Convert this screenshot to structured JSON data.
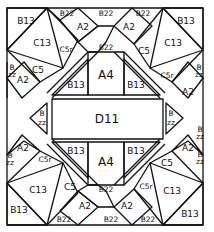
{
  "diagram": {
    "type": "quilt-block-piecing-diagram",
    "line_color": "#111111",
    "background": "#ffffff",
    "center": {
      "label": "D11"
    },
    "center_side_triangles": {
      "left": "B\nzz",
      "right": "B\nzz"
    },
    "top_center": {
      "square": "A4",
      "left_triangle": "B13",
      "right_triangle": "B13",
      "top_triangle": "B22"
    },
    "bottom_center": {
      "square": "A4",
      "left_triangle": "B13",
      "right_triangle": "B13",
      "bottom_triangle": "B22"
    },
    "corners": {
      "top_left": {
        "large_triangle": "B13",
        "square_triangle": "C13",
        "kite_a": "C5r",
        "kite_b": "C5"
      },
      "top_right": {
        "large_triangle": "B13",
        "square_triangle": "C13",
        "kite_a": "C5",
        "kite_b": "C5r"
      },
      "bottom_left": {
        "large_triangle": "B13",
        "square_triangle": "C13",
        "kite_a": "C5r",
        "kite_b": "C5"
      },
      "bottom_right": {
        "large_triangle": "B13",
        "square_triangle": "C13",
        "kite_a": "C5",
        "kite_b": "C5r"
      }
    },
    "diamonds": {
      "top": [
        "A2",
        "A2"
      ],
      "bottom": [
        "A2",
        "A2"
      ],
      "left": [
        "A2",
        "A2"
      ],
      "right": [
        "A2",
        "A2"
      ]
    },
    "edge_triangles": {
      "top": [
        "B22",
        "B22",
        "B22"
      ],
      "bottom": [
        "B22",
        "B22",
        "B22"
      ],
      "left": [
        "B\nzz",
        "B\nzz"
      ],
      "right": [
        "B\nzz",
        "B\nzz"
      ]
    },
    "labels": {
      "D11": "D11",
      "A4": "A4",
      "A2": "A2",
      "B13": "B13",
      "C13": "C13",
      "C5": "C5",
      "C5r": "C5r",
      "B22": "B22",
      "B": "B",
      "zz": "zz"
    }
  }
}
